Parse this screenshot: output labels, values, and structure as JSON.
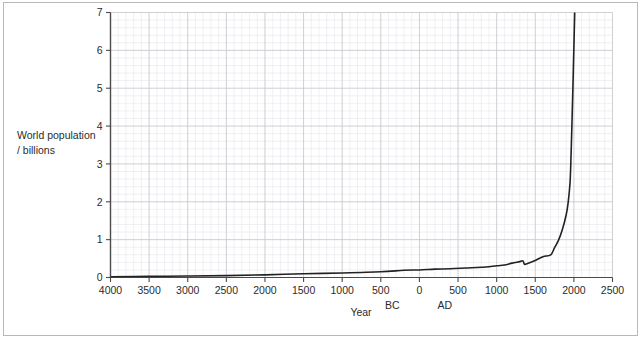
{
  "figure": {
    "background_color": "#ffffff",
    "frame_color": "#b8b8b8"
  },
  "chart_data": {
    "type": "line",
    "title": "",
    "xlabel": "Year",
    "ylabel": "World population / billions",
    "ylabel_line1": "World population",
    "ylabel_line2": "/ billions",
    "xlim": [
      -4000,
      2500
    ],
    "ylim": [
      0,
      7
    ],
    "grid": true,
    "grid_major_color": "#c9c9cf",
    "grid_minor_color": "#e6e6ec",
    "legend": "none",
    "line_color": "#222222",
    "line_width": 1.6,
    "x_tick_labels": [
      "4000",
      "3500",
      "3000",
      "2500",
      "2000",
      "1500",
      "1000",
      "500",
      "0",
      "500",
      "1000",
      "1500",
      "2000",
      "2500"
    ],
    "x_tick_values": [
      -4000,
      -3500,
      -3000,
      -2500,
      -2000,
      -1500,
      -1000,
      -500,
      0,
      500,
      1000,
      1500,
      2000,
      2500
    ],
    "y_tick_labels": [
      "0",
      "1",
      "2",
      "3",
      "4",
      "5",
      "6",
      "7"
    ],
    "y_tick_values": [
      0,
      1,
      2,
      3,
      4,
      5,
      6,
      7
    ],
    "era_labels": [
      {
        "text": "BC",
        "x": -350
      },
      {
        "text": "AD",
        "x": 330
      }
    ],
    "annotations": [
      {
        "text": "plague dip",
        "x": 1350,
        "y": 0.37
      }
    ],
    "x": [
      -4000,
      -3500,
      -3000,
      -2500,
      -2000,
      -1500,
      -1000,
      -500,
      -200,
      0,
      200,
      400,
      600,
      800,
      1000,
      1100,
      1200,
      1300,
      1340,
      1360,
      1400,
      1500,
      1600,
      1700,
      1750,
      1800,
      1850,
      1900,
      1927,
      1950,
      1960,
      1974,
      1987,
      1999,
      2005,
      2011,
      2020
    ],
    "y": [
      0.02,
      0.03,
      0.04,
      0.05,
      0.07,
      0.1,
      0.12,
      0.15,
      0.19,
      0.2,
      0.22,
      0.23,
      0.25,
      0.27,
      0.31,
      0.33,
      0.38,
      0.42,
      0.44,
      0.35,
      0.37,
      0.45,
      0.55,
      0.6,
      0.79,
      0.98,
      1.26,
      1.65,
      2.0,
      2.5,
      3.0,
      4.0,
      5.0,
      6.0,
      6.5,
      7.0,
      7.8
    ]
  }
}
